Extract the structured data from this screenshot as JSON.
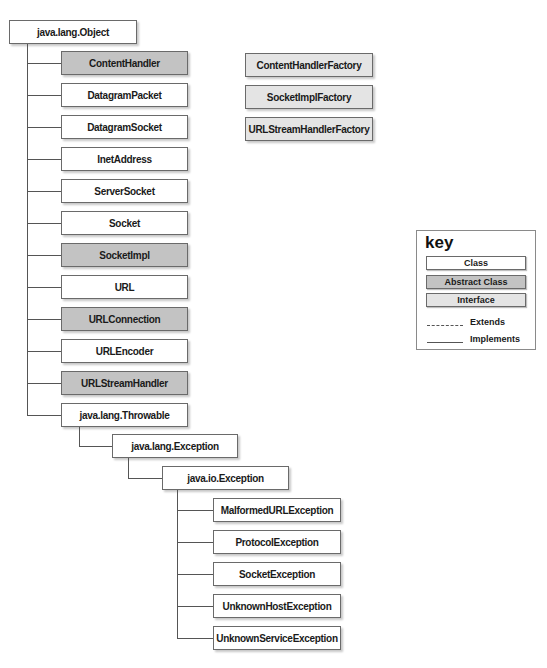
{
  "diagram": {
    "root": {
      "label": "java.lang.Object",
      "kind": "class"
    },
    "interfaces": [
      {
        "label": "ContentHandlerFactory",
        "kind": "interface"
      },
      {
        "label": "SocketImplFactory",
        "kind": "interface"
      },
      {
        "label": "URLStreamHandlerFactory",
        "kind": "interface"
      }
    ],
    "object_children": [
      {
        "label": "ContentHandler",
        "kind": "abstract"
      },
      {
        "label": "DatagramPacket",
        "kind": "class"
      },
      {
        "label": "DatagramSocket",
        "kind": "class"
      },
      {
        "label": "InetAddress",
        "kind": "class"
      },
      {
        "label": "ServerSocket",
        "kind": "class"
      },
      {
        "label": "Socket",
        "kind": "class"
      },
      {
        "label": "SocketImpl",
        "kind": "abstract"
      },
      {
        "label": "URL",
        "kind": "class"
      },
      {
        "label": "URLConnection",
        "kind": "abstract"
      },
      {
        "label": "URLEncoder",
        "kind": "class"
      },
      {
        "label": "URLStreamHandler",
        "kind": "abstract"
      },
      {
        "label": "java.lang.Throwable",
        "kind": "class"
      }
    ],
    "throwable_child": {
      "label": "java.lang.Exception",
      "kind": "class"
    },
    "exception_child": {
      "label": "java.io.Exception",
      "kind": "class"
    },
    "io_exception_children": [
      {
        "label": "MalformedURLException",
        "kind": "class"
      },
      {
        "label": "ProtocolException",
        "kind": "class"
      },
      {
        "label": "SocketException",
        "kind": "class"
      },
      {
        "label": "UnknownHostException",
        "kind": "class"
      },
      {
        "label": "UnknownServiceException",
        "kind": "class"
      }
    ]
  },
  "key": {
    "title": "key",
    "class_label": "Class",
    "abstract_label": "Abstract Class",
    "interface_label": "Interface",
    "extends_label": "Extends",
    "implements_label": "Implements"
  },
  "colors": {
    "class": "#ffffff",
    "abstract": "#c3c3c3",
    "interface": "#e4e4e4",
    "line": "#555555"
  }
}
